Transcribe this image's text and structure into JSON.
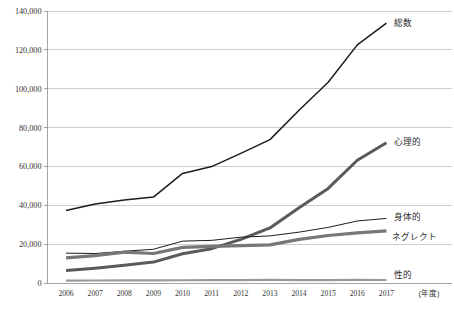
{
  "chart_data": {
    "type": "line",
    "title": "",
    "xlabel": "(年度)",
    "ylabel": "",
    "ylim": [
      0,
      140000
    ],
    "ytick_step": 20000,
    "grid": true,
    "legend_position": "right-inline",
    "categories": [
      "2006",
      "2007",
      "2008",
      "2009",
      "2010",
      "2011",
      "2012",
      "2013",
      "2014",
      "2015",
      "2016",
      "2017"
    ],
    "yticks": [
      "0",
      "20,000",
      "40,000",
      "60,000",
      "80,000",
      "100,000",
      "120,000",
      "140,000"
    ],
    "series": [
      {
        "name": "総数",
        "label": "総数",
        "color": "#1c1c1c",
        "width": 1.5,
        "values": [
          37323,
          40639,
          42664,
          44211,
          56384,
          59919,
          66701,
          73802,
          88931,
          103286,
          122575,
          133778
        ]
      },
      {
        "name": "心理的",
        "label": "心理的",
        "color": "#5a5a5a",
        "width": 3.0,
        "values": [
          6414,
          7621,
          9092,
          10766,
          15068,
          17670,
          22423,
          28348,
          38775,
          48700,
          63186,
          72197
        ]
      },
      {
        "name": "身体的",
        "label": "身体的",
        "color": "#1c1c1c",
        "width": 1.0,
        "values": [
          15364,
          15185,
          16343,
          17371,
          21559,
          21942,
          23579,
          24245,
          26181,
          28621,
          31925,
          33223
        ]
      },
      {
        "name": "ネグレクト",
        "label": "ネグレクト",
        "color": "#777777",
        "width": 3.2,
        "values": [
          12968,
          14063,
          15905,
          15185,
          18352,
          18847,
          19250,
          19627,
          22455,
          24444,
          25842,
          26821
        ]
      },
      {
        "name": "性的",
        "label": "性的",
        "color": "#9a9a9a",
        "width": 2.2,
        "values": [
          1180,
          1293,
          1324,
          1350,
          1405,
          1460,
          1449,
          1582,
          1520,
          1521,
          1622,
          1537
        ]
      }
    ]
  },
  "axis": {
    "unit_note": "(年度)"
  }
}
